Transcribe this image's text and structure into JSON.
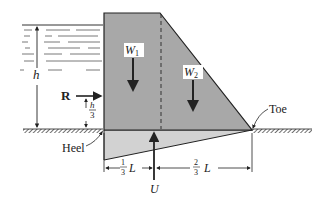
{
  "diagram": {
    "labels": {
      "w1": "W",
      "w1_sub": "1",
      "w2": "W",
      "w2_sub": "2",
      "r": "R",
      "h": "h",
      "h_frac_num": "h",
      "h_frac_den": "3",
      "heel": "Heel",
      "toe": "Toe",
      "u": "U",
      "third_num": "1",
      "third_den": "3",
      "two_thirds_num": "2",
      "two_thirds_den": "3",
      "L1": "L",
      "L2": "L"
    },
    "colors": {
      "dam_fill": "#a8a8a8",
      "uplift_fill": "#cfcfcf",
      "line": "#2a2a2a",
      "water_lines": "#555555"
    }
  }
}
